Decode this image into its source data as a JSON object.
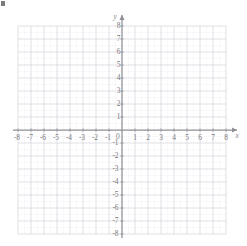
{
  "figure": {
    "kind": "cartesian-coordinate-grid",
    "background_color": "#ffffff",
    "marks": {
      "corner_speck": "scan-artifact-mark"
    }
  },
  "chart_data": {
    "type": "scatter",
    "title": "",
    "subtitle": "",
    "xlabel": "x",
    "ylabel": "y",
    "xlim": [
      -8,
      8
    ],
    "ylim": [
      -8,
      8
    ],
    "x_ticks": [
      -8,
      -7,
      -6,
      -5,
      -4,
      -3,
      -2,
      -1,
      0,
      1,
      2,
      3,
      4,
      5,
      6,
      7,
      8
    ],
    "y_ticks": [
      -8,
      -7,
      -6,
      -5,
      -4,
      -3,
      -2,
      -1,
      0,
      1,
      2,
      3,
      4,
      5,
      6,
      7,
      8
    ],
    "x_tick_labels": [
      "-8",
      "-7",
      "-6",
      "-5",
      "-4",
      "-3",
      "-2",
      "-1",
      "0",
      "1",
      "2",
      "3",
      "4",
      "5",
      "6",
      "7",
      "8"
    ],
    "y_tick_labels": [
      "-8",
      "-7",
      "-6",
      "-5",
      "-4",
      "-3",
      "-2",
      "-1",
      "",
      "1",
      "2",
      "3",
      "4",
      "5",
      "6",
      "7",
      "8"
    ],
    "origin_label": "0",
    "grid": true,
    "minor_grid": true,
    "minor_ticks_per_unit": 2,
    "legend": null,
    "legend_position": "none",
    "series": [],
    "annotations": [],
    "axis_arrows": {
      "x_positive": true,
      "y_positive": true
    },
    "colors": {
      "axis": "#8a8a90",
      "major_grid": "#cfcfd6",
      "minor_grid": "#dedee4",
      "tick_label": "#6d6d70",
      "background": "#ffffff"
    }
  },
  "axis_labels": {
    "x_axis_letter": "x",
    "y_axis_letter": "y"
  }
}
